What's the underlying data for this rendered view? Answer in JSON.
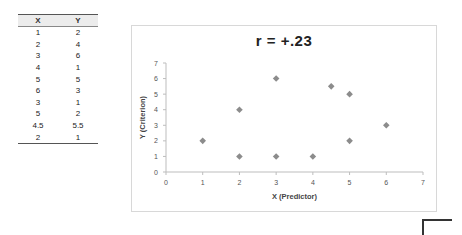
{
  "table": {
    "headers": [
      "X",
      "Y"
    ],
    "rows": [
      [
        "1",
        "2"
      ],
      [
        "2",
        "4"
      ],
      [
        "3",
        "6"
      ],
      [
        "4",
        "1"
      ],
      [
        "5",
        "5"
      ],
      [
        "6",
        "3"
      ],
      [
        "3",
        "1"
      ],
      [
        "5",
        "2"
      ],
      [
        "4.5",
        "5.5"
      ],
      [
        "2",
        "1"
      ]
    ]
  },
  "chart_data": {
    "type": "scatter",
    "title": "r   =   +.23",
    "xlabel": "X (Predictor)",
    "ylabel": "Y (Criterion)",
    "xlim": [
      0,
      7
    ],
    "ylim": [
      0,
      7
    ],
    "x_ticks": [
      "0",
      "1",
      "2",
      "3",
      "4",
      "5",
      "6",
      "7"
    ],
    "y_ticks": [
      "0",
      "1",
      "2",
      "3",
      "4",
      "5",
      "6",
      "7"
    ],
    "grid": false,
    "legend": null,
    "marker": "diamond",
    "marker_color": "#8c8c8c",
    "series": [
      {
        "name": "Y",
        "points": [
          {
            "x": 1,
            "y": 2
          },
          {
            "x": 2,
            "y": 4
          },
          {
            "x": 3,
            "y": 6
          },
          {
            "x": 4,
            "y": 1
          },
          {
            "x": 5,
            "y": 5
          },
          {
            "x": 6,
            "y": 3
          },
          {
            "x": 3,
            "y": 1
          },
          {
            "x": 5,
            "y": 2
          },
          {
            "x": 4.5,
            "y": 5.5
          },
          {
            "x": 2,
            "y": 1
          }
        ]
      }
    ]
  }
}
